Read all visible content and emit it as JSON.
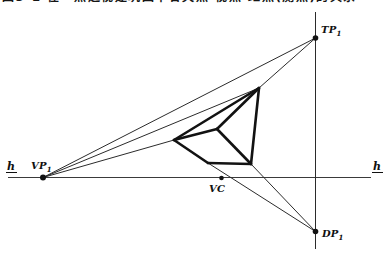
{
  "caption": {
    "text": "图3-1 在一点透视建筑图中各灭点·视点·距点(测点)的关系"
  },
  "labels": {
    "tp1": {
      "base": "TP",
      "sub": "1"
    },
    "dp1": {
      "base": "DP",
      "sub": "1"
    },
    "vp1": {
      "base": "VP",
      "sub": "1"
    },
    "vc": {
      "base": "VC"
    },
    "h_left": {
      "base": "h"
    },
    "h_right": {
      "base": "h"
    }
  },
  "colors": {
    "ink": "#121212",
    "thin_line": "#2b2b2b",
    "background": "#ffffff"
  },
  "diagram": {
    "width": 391,
    "height": 257,
    "points": {
      "VP1": [
        43,
        177.5
      ],
      "TP1": [
        315.5,
        38
      ],
      "DP1": [
        315.5,
        231.5
      ],
      "VC": [
        221.5,
        178
      ],
      "cube_T": [
        259,
        88
      ],
      "cube_L": [
        174,
        140
      ],
      "cube_M": [
        217,
        129
      ],
      "cube_B": [
        208,
        163
      ],
      "cube_BR": [
        251,
        164
      ]
    },
    "thin_lines": [
      {
        "name": "horizon-line",
        "cls": "horizon",
        "x1": 8,
        "y1": 177.5,
        "x2": 371,
        "y2": 177.5
      },
      {
        "name": "vertical-station-line",
        "cls": "axis",
        "x1": 315.5,
        "y1": 12,
        "x2": 315.5,
        "y2": 249
      },
      {
        "name": "sightline-vp1-tp1",
        "cls": "thin",
        "x1": 43,
        "y1": 177.5,
        "x2": 315.5,
        "y2": 38
      },
      {
        "name": "sightline-vp1-cube-top",
        "cls": "thin",
        "x1": 43,
        "y1": 177.5,
        "x2": 259,
        "y2": 88
      },
      {
        "name": "sightline-vp1-cube-left",
        "cls": "thin",
        "x1": 43,
        "y1": 177.5,
        "x2": 174,
        "y2": 140
      },
      {
        "name": "sightline-top-tp1",
        "cls": "thin",
        "x1": 259,
        "y1": 88,
        "x2": 315.5,
        "y2": 38
      },
      {
        "name": "diagonal-b-dp1",
        "cls": "thin",
        "x1": 208,
        "y1": 163,
        "x2": 315.5,
        "y2": 231.5
      },
      {
        "name": "diagonal-br-dp1",
        "cls": "thin",
        "x1": 251,
        "y1": 164,
        "x2": 315.5,
        "y2": 231.5
      }
    ],
    "thick_edges": [
      {
        "name": "cube-edge-top-left",
        "x1": 259,
        "y1": 88,
        "x2": 174,
        "y2": 140
      },
      {
        "name": "cube-edge-left-mid",
        "x1": 174,
        "y1": 140,
        "x2": 217,
        "y2": 129
      },
      {
        "name": "cube-edge-mid-top",
        "x1": 217,
        "y1": 129,
        "x2": 259,
        "y2": 88
      },
      {
        "name": "cube-edge-mid-botright",
        "x1": 217,
        "y1": 129,
        "x2": 251,
        "y2": 164
      },
      {
        "name": "cube-edge-right",
        "x1": 259,
        "y1": 88,
        "x2": 251,
        "y2": 164
      },
      {
        "name": "cube-edge-left-bottom",
        "x1": 174,
        "y1": 140,
        "x2": 208,
        "y2": 163
      },
      {
        "name": "cube-edge-bottom",
        "x1": 208,
        "y1": 163,
        "x2": 251,
        "y2": 164
      }
    ],
    "dots": [
      {
        "name": "vp1-point",
        "x": 43,
        "y": 177.5,
        "r": 3
      },
      {
        "name": "tp1-point",
        "x": 315.5,
        "y": 38,
        "r": 2.8
      },
      {
        "name": "dp1-point",
        "x": 315.5,
        "y": 231.5,
        "r": 2.8
      },
      {
        "name": "vc-point",
        "x": 221.5,
        "y": 178,
        "r": 2.3
      }
    ]
  }
}
